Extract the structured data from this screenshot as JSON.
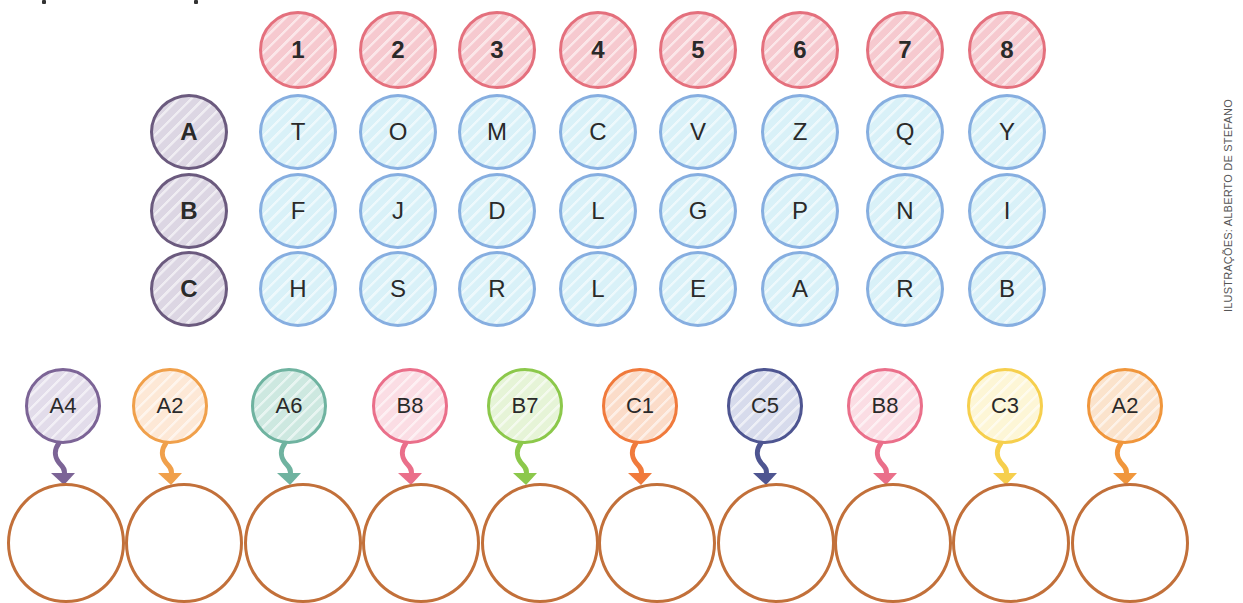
{
  "puzzle": {
    "column_headers": [
      "1",
      "2",
      "3",
      "4",
      "5",
      "6",
      "7",
      "8"
    ],
    "row_headers": [
      "A",
      "B",
      "C"
    ],
    "grid": {
      "A": [
        "T",
        "O",
        "M",
        "C",
        "V",
        "Z",
        "Q",
        "Y"
      ],
      "B": [
        "F",
        "J",
        "D",
        "L",
        "G",
        "P",
        "N",
        "I"
      ],
      "C": [
        "H",
        "S",
        "R",
        "L",
        "E",
        "A",
        "R",
        "B"
      ]
    },
    "clues": [
      {
        "label": "A4",
        "color": "#7c6496",
        "fill": "#e2dcea"
      },
      {
        "label": "A2",
        "color": "#f0a04b",
        "fill": "#fde8d6"
      },
      {
        "label": "A6",
        "color": "#6fb3a0",
        "fill": "#cde8e0"
      },
      {
        "label": "B8",
        "color": "#ea6f8a",
        "fill": "#fbdde4"
      },
      {
        "label": "B7",
        "color": "#8cc84b",
        "fill": "#e6f4d7"
      },
      {
        "label": "C1",
        "color": "#f07a3c",
        "fill": "#fbdcc9"
      },
      {
        "label": "C5",
        "color": "#4e5591",
        "fill": "#d7dbec"
      },
      {
        "label": "B8",
        "color": "#ea6f8a",
        "fill": "#fbdde4"
      },
      {
        "label": "C3",
        "color": "#f6cf4d",
        "fill": "#fdf6d6"
      },
      {
        "label": "A2",
        "color": "#f0963c",
        "fill": "#fbe3cc"
      }
    ],
    "answer_slots": [
      "",
      "",
      "",
      "",
      "",
      "",
      "",
      "",
      "",
      ""
    ]
  },
  "colors": {
    "column_header_border": "#e4707d",
    "column_header_fill": "#f6c9cf",
    "row_header_border": "#6b5a7e",
    "row_header_fill": "#dcd6e3",
    "cell_border": "#86aee0",
    "cell_fill": "#d9f1f8",
    "answer_border": "#c2703a"
  },
  "credit": "ILUSTRAÇÕES: ALBERTO DE STEFANO"
}
